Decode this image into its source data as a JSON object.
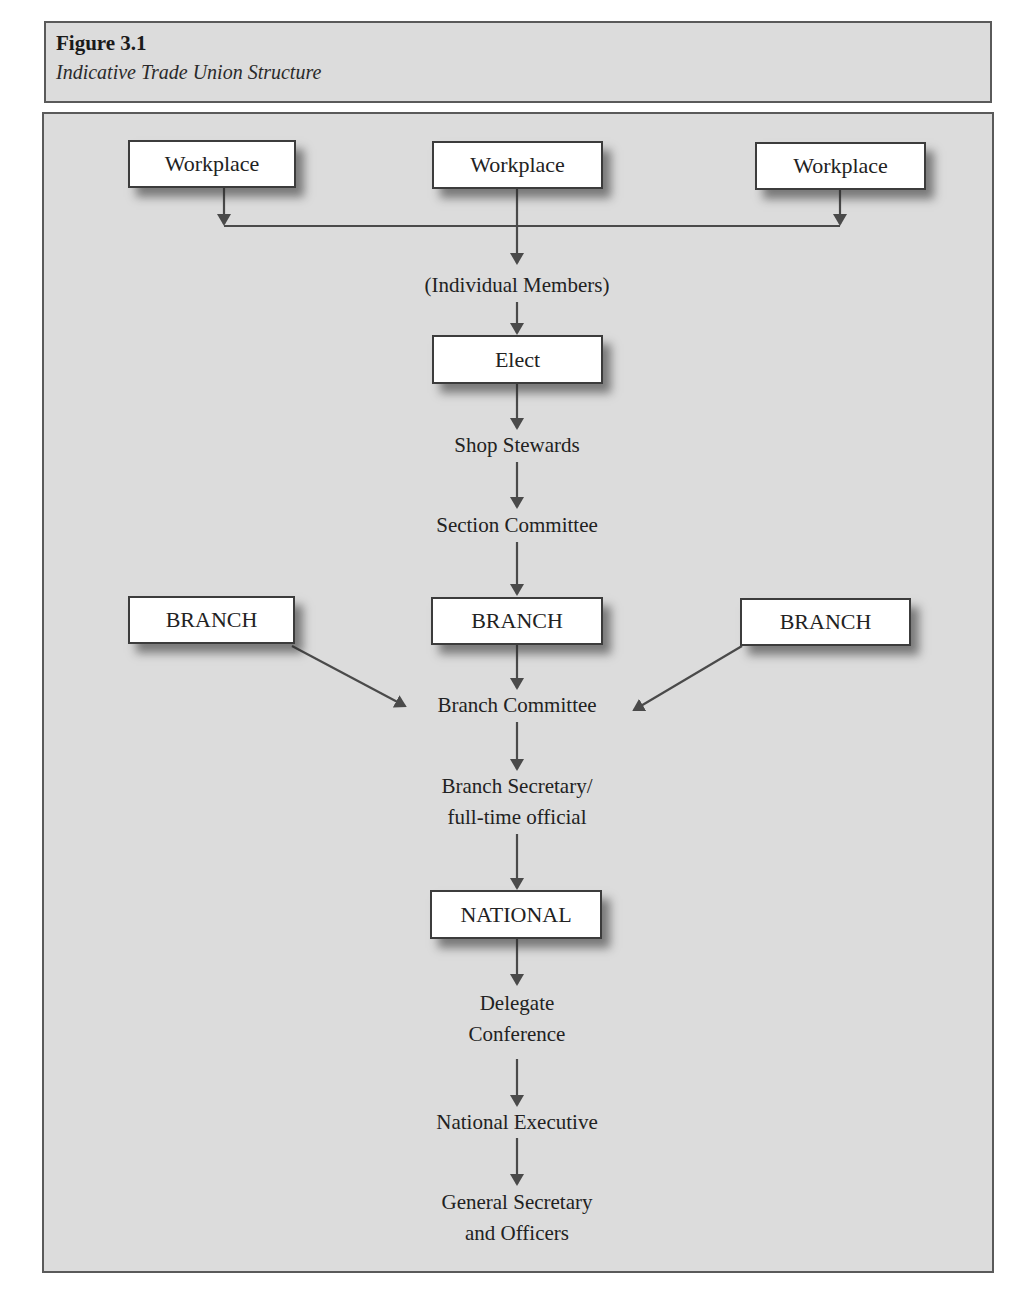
{
  "figure": {
    "number": "Figure 3.1",
    "caption": "Indicative Trade Union Structure"
  },
  "diagram": {
    "workplaces": [
      {
        "label": "Workplace"
      },
      {
        "label": "Workplace"
      },
      {
        "label": "Workplace"
      }
    ],
    "individual_members": "(Individual Members)",
    "elect": "Elect",
    "shop_stewards": "Shop Stewards",
    "section_committee": "Section Committee",
    "branches": [
      {
        "label": "BRANCH"
      },
      {
        "label": "BRANCH"
      },
      {
        "label": "BRANCH"
      }
    ],
    "branch_committee": "Branch Committee",
    "branch_secretary": {
      "line1": "Branch Secretary/",
      "line2": "full-time official"
    },
    "national": "NATIONAL",
    "delegate_conference": {
      "line1": "Delegate",
      "line2": "Conference"
    },
    "national_executive": "National Executive",
    "general_secretary": {
      "line1": "General Secretary",
      "line2": "and Officers"
    }
  },
  "colors": {
    "panel_background": "#dcdcdc",
    "border": "#5a5a5a",
    "arrow": "#4a4a4a",
    "box_fill": "#ffffff"
  }
}
